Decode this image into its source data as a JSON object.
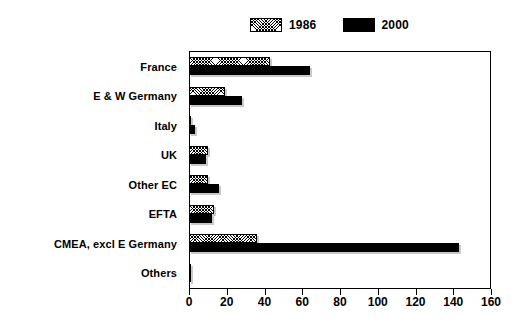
{
  "chart_data": {
    "type": "bar",
    "orientation": "horizontal",
    "title": "",
    "xlabel": "",
    "ylabel": "",
    "xlim": [
      0,
      160
    ],
    "xticks": [
      0,
      20,
      40,
      60,
      80,
      100,
      120,
      140,
      160
    ],
    "grid": false,
    "legend_position": "top-center",
    "categories": [
      "France",
      "E & W Germany",
      "Italy",
      "UK",
      "Other EC",
      "EFTA",
      "CMEA, excl E Germany",
      "Others"
    ],
    "series": [
      {
        "name": "1986",
        "swatch": "hatched",
        "color": "#ffffff",
        "values": [
          43,
          19,
          1,
          10,
          10,
          13,
          36,
          1
        ]
      },
      {
        "name": "2000",
        "swatch": "solid",
        "color": "#000000",
        "values": [
          64,
          28,
          3,
          9,
          16,
          12,
          143,
          1
        ]
      }
    ]
  },
  "legend": {
    "entries": [
      {
        "label": "1986"
      },
      {
        "label": "2000"
      }
    ]
  },
  "colors": {
    "series_1986": "#ffffff",
    "series_2000": "#000000",
    "axis": "#000000",
    "shadow": "#c9c9c9",
    "background": "#ffffff"
  }
}
